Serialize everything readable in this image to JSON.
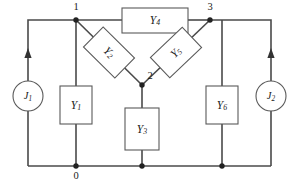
{
  "diagram": {
    "type": "electrical-circuit-schematic",
    "colors": {
      "wire": "#4a4a4a",
      "component_outline": "#5a5a5a",
      "junction_dot": "#222222",
      "text": "#1a1a1a",
      "background": "#ffffff"
    },
    "nodes": [
      {
        "id": "n1",
        "label": "1",
        "x": 76,
        "y": 20
      },
      {
        "id": "n2",
        "label": "2",
        "x": 142,
        "y": 85
      },
      {
        "id": "n3",
        "label": "3",
        "x": 210,
        "y": 20
      },
      {
        "id": "n0",
        "label": "0",
        "x": 76,
        "y": 167
      }
    ],
    "components": [
      {
        "id": "Y1",
        "label": "Y",
        "sub": "1",
        "orientation": "vertical"
      },
      {
        "id": "Y2",
        "label": "Y",
        "sub": "2",
        "orientation": "diagonal-down-right"
      },
      {
        "id": "Y3",
        "label": "Y",
        "sub": "3",
        "orientation": "vertical"
      },
      {
        "id": "Y4",
        "label": "Y",
        "sub": "4",
        "orientation": "horizontal"
      },
      {
        "id": "Y5",
        "label": "Y",
        "sub": "5",
        "orientation": "diagonal-up-right"
      },
      {
        "id": "Y6",
        "label": "Y",
        "sub": "6",
        "orientation": "vertical"
      }
    ],
    "sources": [
      {
        "id": "J1",
        "label": "J",
        "sub": "1",
        "symbol": "current-source",
        "arrow_direction": "up",
        "side": "left"
      },
      {
        "id": "J2",
        "label": "J",
        "sub": "2",
        "symbol": "current-source",
        "arrow_direction": "up",
        "side": "right"
      }
    ]
  }
}
